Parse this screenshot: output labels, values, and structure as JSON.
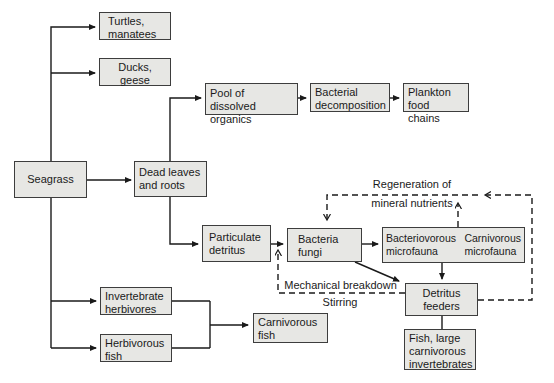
{
  "figure": {
    "type": "flowchart",
    "colors": {
      "background": "#ffffff",
      "box_fill": "#e7e7e4",
      "box_border": "#3d3d3d",
      "line": "#1a1a1a"
    }
  },
  "nodes": {
    "seagrass": "Seagrass",
    "turtles_manatees": [
      "Turtles,",
      "manatees"
    ],
    "ducks_geese": [
      "Ducks,",
      "geese"
    ],
    "pool_dissolved_organics": [
      "Pool of dissolved",
      "organics"
    ],
    "bacterial_decomposition": [
      "Bacterial",
      "decomposition"
    ],
    "plankton_food_chains": [
      "Plankton",
      "food chains"
    ],
    "dead_leaves_roots": [
      "Dead leaves",
      "and roots"
    ],
    "particulate_detritus": [
      "Particulate",
      "detritus"
    ],
    "bacteria_fungi": [
      "Bacteria",
      "fungi"
    ],
    "bacteriovorous_microfauna": [
      "Bacteriovorous",
      "microfauna"
    ],
    "carnivorous_microfauna": [
      "Carnivorous",
      "microfauna"
    ],
    "invertebrate_herbivores": [
      "Invertebrate",
      "herbivores"
    ],
    "herbivorous_fish": [
      "Herbivorous",
      "fish"
    ],
    "carnivorous_fish": [
      "Carnivorous",
      "fish"
    ],
    "detritus_feeders": [
      "Detritus",
      "feeders"
    ],
    "fish_large_carnivorous_invertebrates": [
      "Fish, large",
      "carnivorous",
      "invertebrates"
    ]
  },
  "floating_labels": {
    "regeneration_of_mineral_nutrients": [
      "Regeneration of",
      "mineral nutrients"
    ],
    "mechanical_breakdown": "Mechanical breakdown",
    "stirring": "Stirring"
  },
  "edges": [
    {
      "from": "seagrass",
      "to": "turtles_manatees",
      "style": "solid-arrow"
    },
    {
      "from": "seagrass",
      "to": "ducks_geese",
      "style": "solid-arrow"
    },
    {
      "from": "seagrass",
      "to": "dead_leaves_roots",
      "style": "solid-arrow"
    },
    {
      "from": "seagrass",
      "to": "invertebrate_herbivores",
      "style": "solid-arrow"
    },
    {
      "from": "seagrass",
      "to": "herbivorous_fish",
      "style": "solid-arrow"
    },
    {
      "from": "dead_leaves_roots",
      "to": "pool_dissolved_organics",
      "style": "solid-arrow"
    },
    {
      "from": "pool_dissolved_organics",
      "to": "bacterial_decomposition",
      "style": "solid-arrow"
    },
    {
      "from": "bacterial_decomposition",
      "to": "plankton_food_chains",
      "style": "solid-arrow"
    },
    {
      "from": "dead_leaves_roots",
      "to": "particulate_detritus",
      "style": "solid-arrow"
    },
    {
      "from": "particulate_detritus",
      "to": "bacteria_fungi",
      "style": "solid-arrow"
    },
    {
      "from": "bacteria_fungi",
      "to": "bacteriovorous_microfauna",
      "style": "solid-arrow"
    },
    {
      "from": "bacteria_fungi",
      "to": "detritus_feeders",
      "style": "solid-arrow"
    },
    {
      "from": "bacteriovorous_microfauna",
      "to": "detritus_feeders",
      "style": "solid-arrow"
    },
    {
      "from": "detritus_feeders",
      "to": "fish_large_carnivorous_invertebrates",
      "style": "solid-line"
    },
    {
      "from": "invertebrate_herbivores",
      "to": "carnivorous_fish",
      "style": "solid-arrow"
    },
    {
      "from": "herbivorous_fish",
      "to": "carnivorous_fish",
      "style": "solid-arrow"
    },
    {
      "from": "detritus_feeders",
      "to": "particulate_detritus",
      "style": "dashed-arrow",
      "label": "mechanical_breakdown / stirring"
    },
    {
      "from": "detritus_feeders",
      "to": "bacteria_fungi",
      "style": "dashed-arrow",
      "label": "regeneration_of_mineral_nutrients"
    },
    {
      "from": "bacteriovorous_microfauna",
      "to": "regeneration_of_mineral_nutrients",
      "style": "dashed-arrow"
    }
  ]
}
